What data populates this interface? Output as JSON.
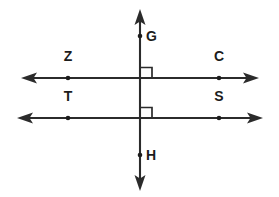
{
  "figure": {
    "background_color": "#ffffff",
    "stroke_color": "#2b2b2b",
    "label_color": "#1c1c1c",
    "width": 279,
    "height": 197
  },
  "labels": {
    "g": "G",
    "h": "H",
    "z": "Z",
    "c": "C",
    "t": "T",
    "s": "S"
  },
  "geometry": {
    "vertical_line": {
      "name": "vertical-transversal",
      "x": 140,
      "y_top": 10,
      "y_bottom": 190,
      "arrows": "both"
    },
    "upper_horizontal_line": {
      "name": "upper-parallel-line",
      "y": 78,
      "x_left": 22,
      "x_right": 258,
      "arrows": "both"
    },
    "lower_horizontal_line": {
      "name": "lower-parallel-line",
      "y": 118,
      "x_left": 18,
      "x_right": 262,
      "arrows": "both"
    },
    "points": [
      {
        "id": "g",
        "label": "G",
        "x": 140,
        "y": 36,
        "label_dx": 6,
        "label_dy": 1
      },
      {
        "id": "z",
        "label": "Z",
        "x": 68,
        "y": 78,
        "label_dx": 0,
        "label_dy": -21
      },
      {
        "id": "c",
        "label": "C",
        "x": 219,
        "y": 78,
        "label_dx": 0,
        "label_dy": -21
      },
      {
        "id": "t",
        "label": "T",
        "x": 68,
        "y": 118,
        "label_dx": 0,
        "label_dy": -21
      },
      {
        "id": "s",
        "label": "S",
        "x": 219,
        "y": 118,
        "label_dx": 0,
        "label_dy": -21
      },
      {
        "id": "h",
        "label": "H",
        "x": 140,
        "y": 155,
        "label_dx": 6,
        "label_dy": 1
      }
    ],
    "right_angle_markers": [
      {
        "id": "upper",
        "x": 141,
        "y": 67,
        "size": 11,
        "quadrant": "upper-right"
      },
      {
        "id": "lower",
        "x": 141,
        "y": 107,
        "size": 11,
        "quadrant": "upper-right"
      }
    ]
  }
}
